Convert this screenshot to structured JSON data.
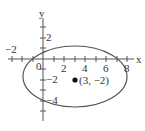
{
  "figure": {
    "type": "ellipse-on-coordinate-plane",
    "axes": {
      "x_label": "x",
      "y_label": "y",
      "x_ticks": [
        {
          "value": -2,
          "label": "−2"
        },
        {
          "value": 0,
          "label": "0"
        },
        {
          "value": 2,
          "label": "2"
        },
        {
          "value": 4,
          "label": "4"
        },
        {
          "value": 6,
          "label": "6"
        },
        {
          "value": 8,
          "label": "8"
        }
      ],
      "y_ticks": [
        {
          "value": 2,
          "label": "2"
        },
        {
          "value": -2,
          "label": "−2"
        },
        {
          "value": -4,
          "label": "−4"
        }
      ]
    },
    "center_point": {
      "x": 3,
      "y": -2,
      "label": "(3, −2)"
    },
    "ellipse": {
      "center": [
        3,
        -2
      ],
      "semi_x": 5,
      "semi_y": 3
    },
    "colors": {
      "stroke": "#555555",
      "point": "#111111"
    }
  }
}
